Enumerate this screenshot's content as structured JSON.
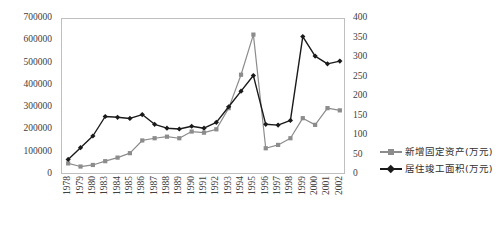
{
  "chart_data": {
    "type": "line",
    "title": "",
    "xlabel": "",
    "ylabel": "",
    "grid": false,
    "legend_position": "right",
    "categories": [
      "1978",
      "1979",
      "1980",
      "1983",
      "1984",
      "1985",
      "1986",
      "1987",
      "1988",
      "1989",
      "1990",
      "1991",
      "1992",
      "1993",
      "1994",
      "1995",
      "1996",
      "1997",
      "1998",
      "1999",
      "2000",
      "2001",
      "2002"
    ],
    "axes": {
      "left": {
        "label": "",
        "min": 0,
        "max": 700000,
        "step": 100000,
        "ticks": [
          "0",
          "100000",
          "200000",
          "300000",
          "400000",
          "500000",
          "600000",
          "700000"
        ]
      },
      "right": {
        "label": "",
        "min": 0,
        "max": 400,
        "step": 50,
        "ticks": [
          "0",
          "50",
          "100",
          "150",
          "200",
          "250",
          "300",
          "350",
          "400"
        ]
      }
    },
    "series": [
      {
        "name": "新增固定资产(万元)",
        "axis": "left",
        "color": "#8c8c8c",
        "marker": "square",
        "values": [
          52000,
          38000,
          45000,
          62000,
          78000,
          98000,
          155000,
          165000,
          172000,
          165000,
          195000,
          190000,
          205000,
          300000,
          450000,
          630000,
          120000,
          135000,
          165000,
          255000,
          225000,
          300000,
          290000
        ]
      },
      {
        "name": "居住竣工面积(万元)",
        "axis": "right",
        "color": "#1a1a1a",
        "marker": "diamond",
        "values": [
          40,
          70,
          100,
          150,
          148,
          145,
          155,
          130,
          120,
          118,
          125,
          120,
          135,
          175,
          215,
          255,
          130,
          128,
          140,
          355,
          305,
          285,
          292
        ]
      }
    ]
  },
  "legend": {
    "items": [
      {
        "label": "新增固定资产(万元)",
        "color": "#8c8c8c",
        "marker": "square"
      },
      {
        "label": "居住竣工面积(万元)",
        "color": "#1a1a1a",
        "marker": "diamond"
      }
    ]
  }
}
